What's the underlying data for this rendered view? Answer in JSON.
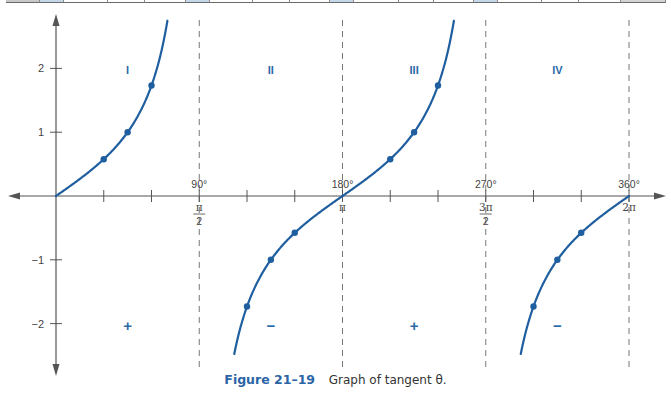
{
  "top_strip": {
    "cells": [
      {
        "x": 6,
        "w": 34,
        "color": "#c9c9c9"
      },
      {
        "x": 40,
        "w": 24,
        "color": "#c5d8ea"
      },
      {
        "x": 64,
        "w": 44,
        "color": "#ffffff"
      },
      {
        "x": 108,
        "w": 37,
        "color": "#ffffff"
      },
      {
        "x": 145,
        "w": 41,
        "color": "#ffffff"
      },
      {
        "x": 186,
        "w": 24,
        "color": "#c5d8ea"
      },
      {
        "x": 210,
        "w": 43,
        "color": "#ffffff"
      },
      {
        "x": 253,
        "w": 37,
        "color": "#ffffff"
      },
      {
        "x": 290,
        "w": 40,
        "color": "#ffffff"
      },
      {
        "x": 330,
        "w": 24,
        "color": "#c5d8ea"
      },
      {
        "x": 354,
        "w": 45,
        "color": "#ffffff"
      },
      {
        "x": 399,
        "w": 35,
        "color": "#ffffff"
      },
      {
        "x": 434,
        "w": 40,
        "color": "#ffffff"
      },
      {
        "x": 474,
        "w": 24,
        "color": "#c5d8ea"
      },
      {
        "x": 498,
        "w": 44,
        "color": "#ffffff"
      },
      {
        "x": 542,
        "w": 37,
        "color": "#ffffff"
      },
      {
        "x": 579,
        "w": 42,
        "color": "#ffffff"
      },
      {
        "x": 621,
        "w": 45,
        "color": "#d4d4d4"
      }
    ]
  },
  "colors": {
    "curve": "#1f5fa0",
    "label": "#2a6aa8",
    "axis": "#555555",
    "dash": "#777777"
  },
  "caption": {
    "figure_label": "Figure 21–19",
    "text": "Graph of tangent θ."
  },
  "chart_data": {
    "type": "line",
    "title": "Graph of tangent θ.",
    "figure_number": "Figure 21–19",
    "xlabel": "θ",
    "ylabel": "tan θ",
    "xlim_deg": [
      0,
      360
    ],
    "ylim": [
      -2.75,
      2.75
    ],
    "y_ticks": [
      {
        "value": 2,
        "label": "2"
      },
      {
        "value": 1,
        "label": "1"
      },
      {
        "value": -1,
        "label": "−1"
      },
      {
        "value": -2,
        "label": "−2"
      }
    ],
    "x_major_ticks": [
      {
        "deg": 90,
        "deg_label": "90°",
        "rad_num": "π",
        "rad_den": "2"
      },
      {
        "deg": 180,
        "deg_label": "180°",
        "rad_num": "π",
        "rad_den": ""
      },
      {
        "deg": 270,
        "deg_label": "270°",
        "rad_num": "3π",
        "rad_den": "2"
      },
      {
        "deg": 360,
        "deg_label": "360°",
        "rad_num": "2π",
        "rad_den": ""
      }
    ],
    "x_minor_ticks_deg": [
      30,
      60,
      120,
      150,
      210,
      240,
      300,
      330
    ],
    "asymptotes_deg": [
      90,
      270
    ],
    "dashed_lines_deg": [
      90,
      180,
      270,
      360
    ],
    "quadrants": [
      {
        "label": "I",
        "sign": "+",
        "center_deg": 45
      },
      {
        "label": "II",
        "sign": "−",
        "center_deg": 135
      },
      {
        "label": "III",
        "sign": "+",
        "center_deg": 225
      },
      {
        "label": "IV",
        "sign": "−",
        "center_deg": 315
      }
    ],
    "series": [
      {
        "name": "tan θ (0°–70°)",
        "range_deg": [
          0,
          70
        ]
      },
      {
        "name": "tan θ (112°–180°)",
        "range_deg": [
          112,
          180
        ]
      },
      {
        "name": "tan θ (180°–250°)",
        "range_deg": [
          180,
          250
        ]
      },
      {
        "name": "tan θ (292°–360°)",
        "range_deg": [
          292,
          360
        ]
      }
    ],
    "points": [
      {
        "deg": 30,
        "value": 0.577
      },
      {
        "deg": 45,
        "value": 1.0
      },
      {
        "deg": 60,
        "value": 1.732
      },
      {
        "deg": 120,
        "value": -1.732
      },
      {
        "deg": 135,
        "value": -1.0
      },
      {
        "deg": 150,
        "value": -0.577
      },
      {
        "deg": 210,
        "value": 0.577
      },
      {
        "deg": 225,
        "value": 1.0
      },
      {
        "deg": 240,
        "value": 1.732
      },
      {
        "deg": 300,
        "value": -1.732
      },
      {
        "deg": 315,
        "value": -1.0
      },
      {
        "deg": 330,
        "value": -0.577
      }
    ],
    "grid": false,
    "legend": null
  }
}
